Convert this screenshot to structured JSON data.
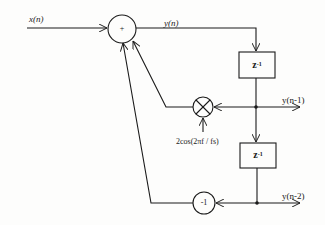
{
  "diagram": {
    "type": "block-diagram",
    "input": {
      "label": "x(n)"
    },
    "adder": {
      "symbol": "+"
    },
    "output": {
      "label": "y(n)"
    },
    "delays": [
      {
        "id": "delay-1",
        "label": "z",
        "exponent": "-1"
      },
      {
        "id": "delay-2",
        "label": "z",
        "exponent": "-1"
      }
    ],
    "taps": [
      {
        "id": "tap-1",
        "label": "y(n-1)"
      },
      {
        "id": "tap-2",
        "label": "y(n-2)"
      }
    ],
    "multiplier": {
      "symbol": "×",
      "coefficient_label": "2cos(2πf / fs)"
    },
    "gain": {
      "symbol": "-1"
    },
    "colors": {
      "line": "#1a1a1a",
      "background": "#fdfdfc"
    }
  }
}
